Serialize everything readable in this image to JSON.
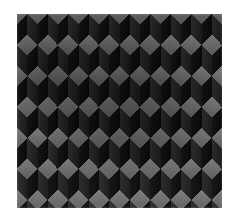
{
  "page": {
    "background_color": "#ffffff",
    "width": 237,
    "height": 220
  },
  "artwork": {
    "title": "",
    "alt_text": "",
    "kind": "isometric-cube-tiling",
    "frame": {
      "x": 17,
      "y": 14,
      "width": 205,
      "height": 194
    }
  },
  "chart_data": {
    "type": "heatmap",
    "title": "",
    "subtitle": "",
    "xlabel": "",
    "ylabel": "",
    "grid": false,
    "legend_position": "none",
    "pattern": {
      "name": "tumbling-blocks",
      "description": "Grayscale isometric cube (rhombille) tiling optical illusion",
      "cell_width": 20.5,
      "cell_height": 31,
      "top_face_height": 10.3,
      "side_face_height": 20.6,
      "columns": 10,
      "rows": 7,
      "row_offset_x": 10.25,
      "row_offset_y": 15.5
    },
    "faces": [
      {
        "name": "top",
        "color": "#6b6b6b",
        "shade": "light"
      },
      {
        "name": "left",
        "color": "#242424",
        "shade": "medium-dark"
      },
      {
        "name": "right",
        "color": "#0e0e0e",
        "shade": "dark"
      }
    ],
    "palette": {
      "background": "#101010",
      "lightest": "#7a7a7a",
      "mid": "#4a4a4a",
      "dark": "#242424",
      "darkest": "#090909",
      "paper": "#ffffff"
    },
    "shading": {
      "vignette": true,
      "vignette_center_x_pct": 52,
      "vignette_center_y_pct": 42,
      "noise": true
    }
  }
}
